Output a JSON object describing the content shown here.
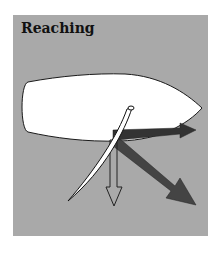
{
  "diagram": {
    "title": "Reaching",
    "colors": {
      "background": "#ffffff",
      "panel": "#a9a9a9",
      "hull": "#ffffff",
      "outline": "#1a1a1a",
      "force_arrow_dark": "#3a3a3a",
      "force_arrow_total": "#4a4a4a",
      "drift_arrow": "#ffffff"
    },
    "elements": [
      {
        "name": "hull",
        "description": "boat hull seen from above, bow to the right"
      },
      {
        "name": "sail",
        "description": "sail angled from mast down-left"
      },
      {
        "name": "forward-force-arrow",
        "description": "dark arrow pointing right (forward drive)"
      },
      {
        "name": "total-force-arrow",
        "description": "dark arrow pointing down-right (total sail force)"
      },
      {
        "name": "sideways-force-arrow",
        "description": "white outlined arrow pointing down (heeling/sideways force)"
      }
    ]
  }
}
